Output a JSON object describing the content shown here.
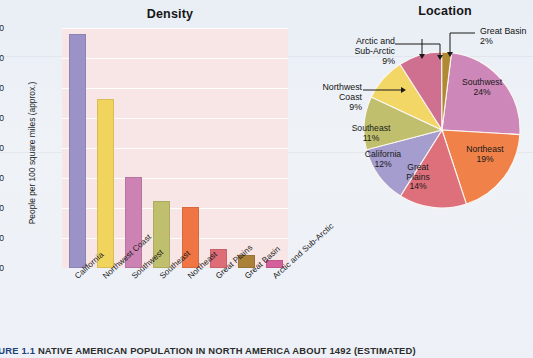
{
  "figure": {
    "number": "FIGURE 1.1",
    "caption": "NATIVE AMERICAN POPULATION IN NORTH AMERICA ABOUT 1492 (ESTIMATED)"
  },
  "bar_panel": {
    "title": "Density"
  },
  "pie_panel": {
    "title": "Location"
  },
  "colors": {
    "background": "#eef2f7",
    "plot_area": "#f8e6e6",
    "gridline": "#fffdfd",
    "caption_accent": "#1d3f7a"
  },
  "chart_data": [
    {
      "type": "bar",
      "title": "Density",
      "xlabel": "",
      "ylabel": "People per 100 square miles (approx.)",
      "ylim": [
        0,
        400
      ],
      "yticks": [
        0,
        50,
        100,
        150,
        200,
        250,
        300,
        350,
        400
      ],
      "grid": true,
      "categories": [
        "California",
        "Northwest Coast",
        "Southwest",
        "Southeast",
        "Northeast",
        "Great Plains",
        "Great Basin",
        "Arctic and Sub-Arctic"
      ],
      "values": [
        390,
        282,
        151,
        112,
        102,
        32,
        22,
        13
      ],
      "bar_colors": [
        "#9b93c8",
        "#f0d45e",
        "#cd82b4",
        "#bfbf6d",
        "#ef7545",
        "#de6d77",
        "#ab8039",
        "#d4619c"
      ]
    },
    {
      "type": "pie",
      "title": "Location",
      "legend": "labels-on-slices",
      "labels": [
        "Southwest",
        "Northeast",
        "Great Plains",
        "California",
        "Southeast",
        "Northwest Coast",
        "Arctic and Sub-Arctic",
        "Great Basin"
      ],
      "values": [
        24,
        19,
        14,
        12,
        11,
        9,
        9,
        2
      ],
      "value_suffix": "%",
      "slice_colors": [
        "#cd87b8",
        "#ef8149",
        "#dd707b",
        "#a49dcd",
        "#bfbf6d",
        "#f2d766",
        "#cf7090",
        "#b08a32"
      ]
    }
  ],
  "bar_labels": {
    "y_axis_title": "People per 100 square miles (approx.)"
  },
  "pie_labels": {
    "southwest": {
      "name": "Southwest",
      "pct": "24%"
    },
    "northeast": {
      "name": "Northeast",
      "pct": "19%"
    },
    "great_plains_l1": "Great",
    "great_plains_l2": "Plains",
    "great_plains_pct": "14%",
    "california": {
      "name": "California",
      "pct": "12%"
    },
    "southeast": {
      "name": "Southeast",
      "pct": "11%"
    },
    "northwest_coast_l1": "Northwest",
    "northwest_coast_l2": "Coast",
    "northwest_coast_pct": "9%",
    "arctic_l1": "Arctic and",
    "arctic_l2": "Sub-Arctic",
    "arctic_pct": "9%",
    "great_basin_l1": "Great Basin",
    "great_basin_pct": "2%"
  }
}
